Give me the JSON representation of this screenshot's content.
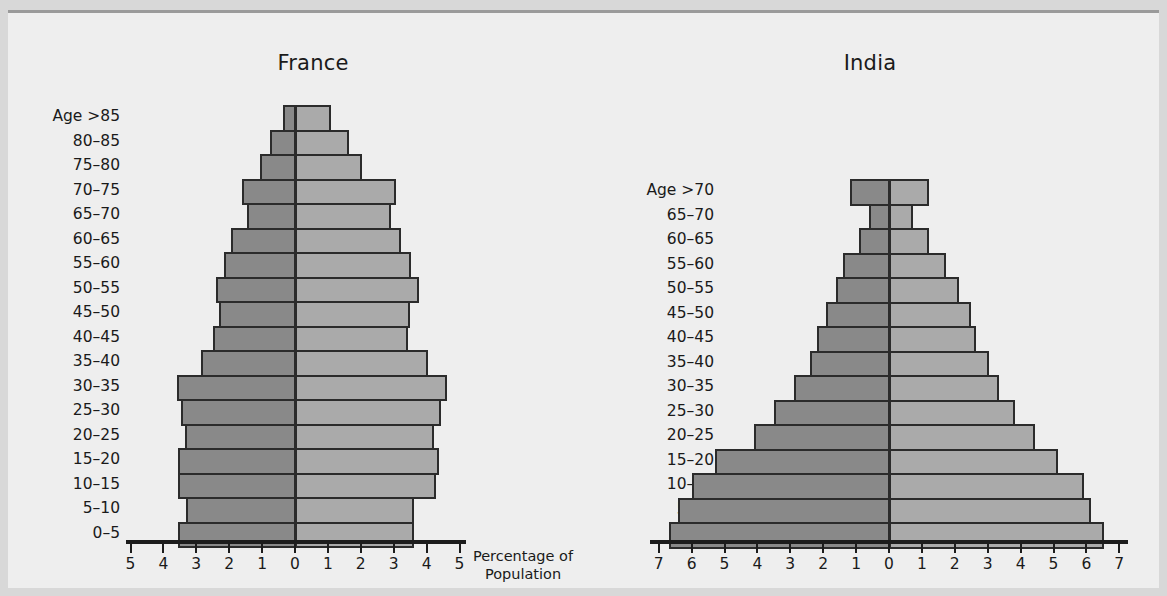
{
  "figure": {
    "axis_caption_line1": "Percentage of",
    "axis_caption_line2": "Population",
    "colors": {
      "male_bar": "#898989",
      "female_bar": "#aaaaaa",
      "bar_outline": "#2b2b2b",
      "background": "#eeeeee",
      "outer_background": "#d8d8d8",
      "text": "#1a1a1a"
    }
  },
  "chart_data": [
    {
      "type": "bar",
      "title": "France",
      "subtype": "population-pyramid",
      "xlabel": "Percentage of Population",
      "ylabel": "Age",
      "age_label_prefix": "Age",
      "xlim": [
        -5,
        5
      ],
      "xticks": [
        5,
        4,
        3,
        2,
        1,
        0,
        1,
        2,
        3,
        4,
        5
      ],
      "grid": false,
      "legend": [],
      "categories": [
        ">85",
        "80-85",
        "75-80",
        "70-75",
        "65-70",
        "60-65",
        "55-60",
        "50-55",
        "45-50",
        "40-45",
        "35-40",
        "30-35",
        "25-30",
        "20-25",
        "15-20",
        "10-15",
        "5-10",
        "0-5"
      ],
      "series": [
        {
          "name": "Male",
          "side": "left",
          "values": [
            0.35,
            0.75,
            1.05,
            1.6,
            1.45,
            1.95,
            2.15,
            2.4,
            2.3,
            2.5,
            2.85,
            3.6,
            3.45,
            3.35,
            3.55,
            3.55,
            3.3,
            3.55
          ]
        },
        {
          "name": "Female",
          "side": "right",
          "values": [
            1.05,
            1.6,
            2.0,
            3.05,
            2.9,
            3.2,
            3.5,
            3.75,
            3.45,
            3.4,
            4.0,
            4.6,
            4.4,
            4.2,
            4.35,
            4.25,
            3.6,
            3.6
          ]
        }
      ]
    },
    {
      "type": "bar",
      "title": "India",
      "subtype": "population-pyramid",
      "xlabel": "Percentage of Population",
      "ylabel": "Age",
      "age_label_prefix": "Age",
      "xlim": [
        -7,
        7
      ],
      "xticks": [
        7,
        6,
        5,
        4,
        3,
        2,
        1,
        0,
        1,
        2,
        3,
        4,
        5,
        6,
        7
      ],
      "grid": false,
      "legend": [],
      "categories": [
        ">70",
        "65-70",
        "60-65",
        "55-60",
        "50-55",
        "45-50",
        "40-45",
        "35-40",
        "30-35",
        "25-30",
        "20-25",
        "15-20",
        "10-15",
        "5-10",
        "0-5"
      ],
      "series": [
        {
          "name": "Male",
          "side": "left",
          "values": [
            1.2,
            0.6,
            0.9,
            1.4,
            1.6,
            1.9,
            2.2,
            2.4,
            2.9,
            3.5,
            4.1,
            5.3,
            6.0,
            6.4,
            6.7
          ]
        },
        {
          "name": "Female",
          "side": "right",
          "values": [
            1.2,
            0.7,
            1.2,
            1.7,
            2.1,
            2.45,
            2.6,
            3.0,
            3.3,
            3.8,
            4.4,
            5.1,
            5.9,
            6.1,
            6.5
          ]
        }
      ]
    }
  ]
}
